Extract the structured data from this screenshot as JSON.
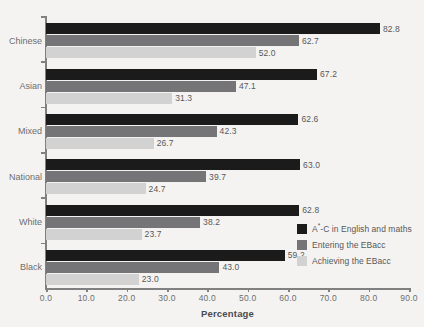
{
  "chart_data": {
    "type": "bar",
    "orientation": "horizontal",
    "title": "",
    "xlabel": "Percentage",
    "ylabel": "",
    "xlim": [
      0.0,
      90.0
    ],
    "xticks": [
      "0.0",
      "10.0",
      "20.0",
      "30.0",
      "40.0",
      "50.0",
      "60.0",
      "70.0",
      "80.0",
      "90.0"
    ],
    "xtick_values": [
      0,
      10,
      20,
      30,
      40,
      50,
      60,
      70,
      80,
      90
    ],
    "grid": false,
    "legend_position": "inside-bottom-right",
    "categories": [
      "Chinese",
      "Asian",
      "Mixed",
      "National",
      "White",
      "Black"
    ],
    "series": [
      {
        "name": "A*-C in English and maths",
        "name_prefix": "A",
        "name_sup": "*",
        "name_suffix": "-C in English and maths",
        "color": "#1b1b1b",
        "values": [
          82.8,
          67.2,
          62.6,
          63.0,
          62.8,
          59.2
        ],
        "labels": [
          "82.8",
          "67.2",
          "62.6",
          "63.0",
          "62.8",
          "59.2"
        ]
      },
      {
        "name": "Entering the EBacc",
        "color": "#757577",
        "values": [
          62.7,
          47.1,
          42.3,
          39.7,
          38.2,
          43.0
        ],
        "labels": [
          "62.7",
          "47.1",
          "42.3",
          "39.7",
          "38.2",
          "43.0"
        ]
      },
      {
        "name": "Achieving the EBacc",
        "color": "#d2d2d2",
        "values": [
          52.0,
          31.3,
          26.7,
          24.7,
          23.7,
          23.0
        ],
        "labels": [
          "52.0",
          "31.3",
          "26.7",
          "24.7",
          "23.7",
          "23.0"
        ]
      }
    ]
  },
  "style": {
    "background": "#f4f3f1",
    "axis_color": "#808080",
    "label_color": "#6d6e70",
    "value_label_color": "#58585a"
  }
}
